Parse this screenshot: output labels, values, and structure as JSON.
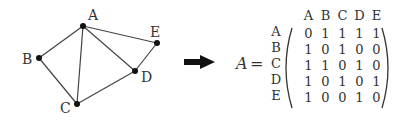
{
  "graph": {
    "nodes": [
      {
        "id": "A",
        "x": 83,
        "y": 26
      },
      {
        "id": "B",
        "x": 39,
        "y": 58
      },
      {
        "id": "C",
        "x": 77,
        "y": 104
      },
      {
        "id": "D",
        "x": 135,
        "y": 71
      },
      {
        "id": "E",
        "x": 157,
        "y": 43
      }
    ],
    "edges": [
      [
        "A",
        "B"
      ],
      [
        "A",
        "C"
      ],
      [
        "A",
        "D"
      ],
      [
        "A",
        "E"
      ],
      [
        "B",
        "C"
      ],
      [
        "C",
        "D"
      ],
      [
        "D",
        "E"
      ]
    ],
    "labels": {
      "A": "A",
      "B": "B",
      "C": "C",
      "D": "D",
      "E": "E"
    }
  },
  "arrow": {
    "icon": "right-arrow-icon"
  },
  "matrix": {
    "lhs": "A",
    "equals": "=",
    "col_headers": [
      "A",
      "B",
      "C",
      "D",
      "E"
    ],
    "row_headers": [
      "A",
      "B",
      "C",
      "D",
      "E"
    ],
    "rows": [
      [
        "0",
        "1",
        "1",
        "1",
        "1"
      ],
      [
        "1",
        "0",
        "1",
        "0",
        "0"
      ],
      [
        "1",
        "1",
        "0",
        "1",
        "0"
      ],
      [
        "1",
        "0",
        "1",
        "0",
        "1"
      ],
      [
        "1",
        "0",
        "0",
        "1",
        "0"
      ]
    ]
  }
}
